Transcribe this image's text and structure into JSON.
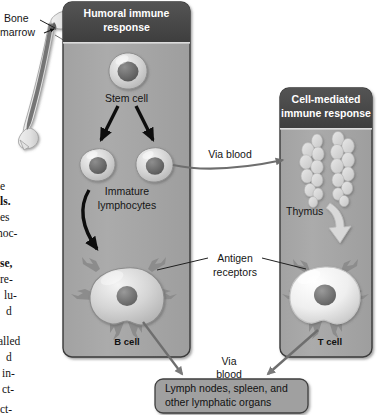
{
  "figure": {
    "kind": "biology-diagram"
  },
  "colors": {
    "page_background": "#ffffff",
    "panel_fill": "#a8a8a8",
    "panel_header_fill": "#4a4a4a",
    "panel_header_text": "#ffffff",
    "panel_border": "#3a3a3a",
    "box_fill": "#a0a0a0",
    "box_border": "#3f3f3f",
    "arrow_black": "#0d0d0d",
    "arrow_gray": "#6e6e6e",
    "leader_line": "#1f1f1f",
    "bone_fill": "#e6e6e6",
    "bone_marrow": "#6f6f6f",
    "b_cell_fill": "#cfcfcf",
    "t_cell_fill": "#f2f2f2",
    "nucleus_fill": "#6a6a6a",
    "thymus_fill": "#dcdcdc",
    "receptor_fill": "#8c8c8c",
    "text_dark": "#151515"
  },
  "left_panel": {
    "name": "humoral-panel",
    "title_line1": "Humoral immune",
    "title_line2": "response",
    "stem_cell_label": "Stem cell",
    "immature_label_line1": "Immature",
    "immature_label_line2": "lymphocytes",
    "b_cell_label": "B cell"
  },
  "right_panel": {
    "name": "cell-mediated-panel",
    "title_line1": "Cell-mediated",
    "title_line2": "immune response",
    "thymus_label": "Thymus",
    "t_cell_label": "T cell"
  },
  "annotations": {
    "bone_marrow_line1": "Bone",
    "bone_marrow_line2": "marrow",
    "via_blood_top": "Via blood",
    "antigen_receptors_line1": "Antigen",
    "antigen_receptors_line2": "receptors",
    "via_blood_bottom_line1": "Via",
    "via_blood_bottom_line2": "blood"
  },
  "bottom_box": {
    "line1": "Lymph nodes, spleen, and",
    "line2": "other lymphatic organs"
  },
  "bleed_text_column": {
    "note": "clipped serif body text from the adjacent page column",
    "lines": [
      {
        "text": "e",
        "bold": false,
        "top": 181,
        "left": 0
      },
      {
        "text": "ls.",
        "bold": true,
        "top": 196,
        "left": 0
      },
      {
        "text": "es",
        "bold": false,
        "top": 212,
        "left": 0
      },
      {
        "text": "noc-",
        "bold": false,
        "top": 228,
        "left": -3
      },
      {
        "text": "se,",
        "bold": true,
        "top": 258,
        "left": 0
      },
      {
        "text": "re-",
        "bold": false,
        "top": 274,
        "left": 0
      },
      {
        "text": "lu-",
        "bold": false,
        "top": 290,
        "left": 4
      },
      {
        "text": "d",
        "bold": false,
        "top": 306,
        "left": 6
      },
      {
        "text": "alled",
        "bold": false,
        "top": 336,
        "left": -2
      },
      {
        "text": "d",
        "bold": false,
        "top": 352,
        "left": 6
      },
      {
        "text": "in-",
        "bold": false,
        "top": 368,
        "left": 2
      },
      {
        "text": "ct-",
        "bold": false,
        "top": 384,
        "left": 2
      },
      {
        "text": "ct-",
        "bold": false,
        "top": 404,
        "left": 0
      }
    ]
  }
}
